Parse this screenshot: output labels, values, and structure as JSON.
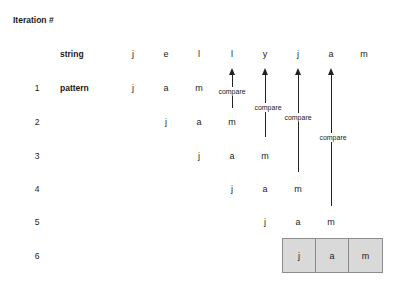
{
  "title": "Iteration #",
  "string_row": {
    "label": "string",
    "chars": [
      "j",
      "e",
      "l",
      "l",
      "y",
      "j",
      "a",
      "m"
    ]
  },
  "pattern_label": "pattern",
  "iterations": [
    {
      "num": "1",
      "start_col": 0,
      "chars": [
        "j",
        "a",
        "m"
      ]
    },
    {
      "num": "2",
      "start_col": 1,
      "chars": [
        "j",
        "a",
        "m"
      ]
    },
    {
      "num": "3",
      "start_col": 2,
      "chars": [
        "j",
        "a",
        "m"
      ]
    },
    {
      "num": "4",
      "start_col": 3,
      "chars": [
        "j",
        "a",
        "m"
      ]
    },
    {
      "num": "5",
      "start_col": 4,
      "chars": [
        "j",
        "a",
        "m"
      ]
    },
    {
      "num": "6",
      "start_col": 5,
      "chars": [
        "j",
        "a",
        "m"
      ],
      "highlighted": true
    }
  ],
  "compare_label": "compare",
  "compares": [
    {
      "label": "compare",
      "string_col": 3,
      "from_iteration": "1"
    },
    {
      "label": "compare",
      "string_col": 4,
      "from_iteration": "2"
    },
    {
      "label": "compare",
      "string_col": 5,
      "from_iteration": "3"
    },
    {
      "label": "compare",
      "string_col": 6,
      "from_iteration": "4"
    }
  ],
  "colors": {
    "text": "#1a1a1a",
    "match_box_fill": "#d9d9d9",
    "match_box_border": "#8c8c8c",
    "arrow": "#222222"
  }
}
